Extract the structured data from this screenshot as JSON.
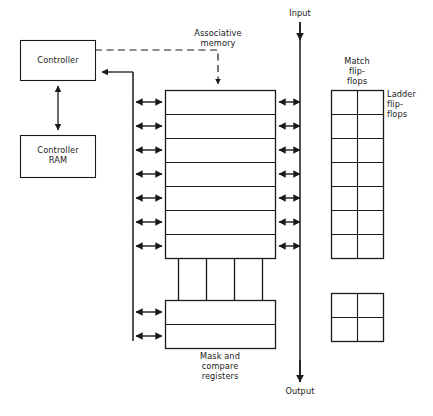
{
  "diagram": {
    "background_color": "#ffffff",
    "line_color": "#1a1a1a",
    "text_color": "#1a1a1a",
    "labels": {
      "controller": "Controller",
      "controller_ram": "Controller\nRAM",
      "associative_memory": "Associative\nmemory",
      "input": "Input",
      "output": "Output",
      "match_flip_flops": "Match\nflip-\nflops",
      "ladder_flip_flops": "Ladder\nflip-\nflops",
      "mask_and_compare_registers": "Mask and\ncompare\nregisters"
    },
    "blocks": {
      "controller": {
        "x": 20,
        "y": 40,
        "width": 75,
        "height": 40
      },
      "controller_ram": {
        "x": 20,
        "y": 135,
        "width": 75,
        "height": 42
      },
      "memory_array": {
        "x": 165,
        "y": 90,
        "width": 110,
        "height": 168,
        "rows": 7,
        "row_height": 24
      },
      "register_cells": {
        "x": 178,
        "y": 265,
        "width": 84,
        "height": 27,
        "columns": 4
      },
      "mask_compare_registers": {
        "x": 165,
        "y": 300,
        "width": 110,
        "height": 48,
        "rows": 2
      },
      "match_flip_flops_grid": {
        "x": 331,
        "y": 90,
        "width": 52,
        "height": 168,
        "rows": 7,
        "columns": 2
      },
      "ladder_flip_flops_grid": {
        "x": 331,
        "y": 293,
        "width": 52,
        "height": 48,
        "rows": 2,
        "columns": 2
      }
    },
    "bus": {
      "left_vertical_x": 133,
      "io_vertical_x": 300,
      "io_top_y": 22,
      "io_bottom_y": 382
    },
    "connections": {
      "left_bus_to_memory_arrows": 7,
      "left_bus_to_registers_arrows": 2,
      "memory_to_io_arrows": 7,
      "controller_to_ram": "bidirectional",
      "controller_to_bus": "leftward",
      "controller_to_memory_dashed": "downward"
    }
  }
}
